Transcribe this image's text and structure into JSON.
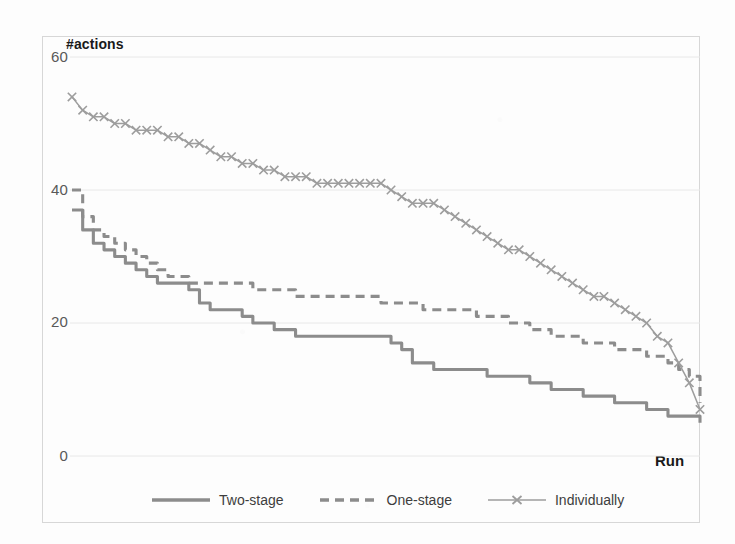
{
  "chart_data": {
    "type": "line",
    "title": "",
    "subtitle": "",
    "xlabel": "Run",
    "ylabel": "#actions",
    "grid": true,
    "legend_position": "bottom",
    "xlim": [
      0,
      100
    ],
    "ylim": [
      0,
      60
    ],
    "y_ticks": [
      0,
      20,
      40,
      60
    ],
    "y_tick_labels": [
      "0",
      "20",
      "40",
      "60"
    ],
    "x_ticks": [],
    "x_tick_labels": [],
    "x": [
      0,
      1.7,
      3.4,
      5.1,
      6.8,
      8.5,
      10.2,
      11.9,
      13.6,
      15.3,
      17.0,
      18.6,
      20.3,
      22.0,
      23.7,
      25.4,
      27.1,
      28.8,
      30.5,
      32.2,
      33.9,
      35.6,
      37.3,
      39.0,
      40.7,
      42.4,
      44.1,
      45.8,
      47.5,
      49.2,
      50.8,
      52.5,
      54.2,
      55.9,
      57.6,
      59.3,
      61.0,
      62.7,
      64.4,
      66.1,
      67.8,
      69.5,
      71.2,
      72.9,
      74.6,
      76.3,
      78.0,
      79.7,
      81.4,
      83.1,
      84.7,
      86.4,
      88.1,
      89.8,
      91.5,
      93.2,
      94.9,
      96.6,
      98.3,
      100.0
    ],
    "series": [
      {
        "name": "Two-stage",
        "style": "solid",
        "marker": "none",
        "color": "#8c8c8c",
        "values": [
          37,
          34,
          32,
          31,
          30,
          29,
          28,
          27,
          26,
          26,
          26,
          25,
          23,
          22,
          22,
          22,
          21,
          20,
          20,
          19,
          19,
          18,
          18,
          18,
          18,
          18,
          18,
          18,
          18,
          18,
          17,
          16,
          14,
          14,
          13,
          13,
          13,
          13,
          13,
          12,
          12,
          12,
          12,
          11,
          11,
          10,
          10,
          10,
          9,
          9,
          9,
          8,
          8,
          8,
          7,
          7,
          6,
          6,
          6,
          5
        ]
      },
      {
        "name": "One-stage",
        "style": "dashed",
        "marker": "none",
        "color": "#8c8c8c",
        "values": [
          40,
          36,
          34,
          33,
          32,
          31,
          30,
          29,
          28,
          27,
          27,
          26,
          26,
          26,
          26,
          26,
          26,
          25,
          25,
          25,
          25,
          24,
          24,
          24,
          24,
          24,
          24,
          24,
          24,
          23,
          23,
          23,
          23,
          22,
          22,
          22,
          22,
          22,
          21,
          21,
          21,
          20,
          20,
          19,
          19,
          18,
          18,
          18,
          17,
          17,
          17,
          16,
          16,
          16,
          15,
          15,
          14,
          13,
          12,
          8
        ]
      },
      {
        "name": "Individually",
        "style": "solid",
        "marker": "x",
        "color": "#9d9d9d",
        "values": [
          54,
          52,
          51,
          51,
          50,
          50,
          49,
          49,
          49,
          48,
          48,
          47,
          47,
          46,
          45,
          45,
          44,
          44,
          43,
          43,
          42,
          42,
          42,
          41,
          41,
          41,
          41,
          41,
          41,
          41,
          40,
          39,
          38,
          38,
          38,
          37,
          36,
          35,
          34,
          33,
          32,
          31,
          31,
          30,
          29,
          28,
          27,
          26,
          25,
          24,
          24,
          23,
          22,
          21,
          20,
          18,
          17,
          14,
          11,
          7
        ]
      }
    ]
  },
  "axes": {
    "y_title": "#actions",
    "x_title": "Run",
    "y_tick_labels": [
      "60",
      "40",
      "20",
      "0"
    ]
  },
  "legend": {
    "entries": [
      {
        "label": "Two-stage",
        "swatch": "solid-line-swatch"
      },
      {
        "label": "One-stage",
        "swatch": "dashed-line-swatch"
      },
      {
        "label": "Individually",
        "swatch": "line-with-x-marker-swatch"
      }
    ]
  },
  "colors": {
    "series_gray": "#8c8c8c",
    "marker_gray": "#9d9d9d",
    "gridline": "#e8e8e8",
    "frame": "#d7d7d7",
    "tick_text": "#595959",
    "title_text": "#1a1a1a"
  }
}
